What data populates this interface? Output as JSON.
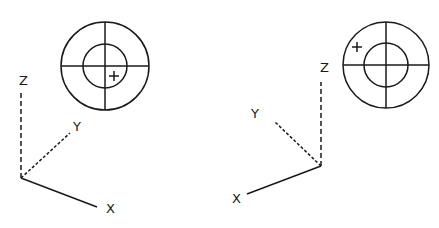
{
  "diagrams": [
    {
      "id": "left",
      "target": {
        "cx": 105,
        "cy": 66,
        "r_outer": 44,
        "r_inner": 22,
        "plus": {
          "x": 114,
          "y": 76
        }
      },
      "axes": {
        "origin": {
          "x": 21,
          "y": 178
        },
        "z": {
          "label": "Z",
          "start_y": 93,
          "label_x": 23,
          "label_y": 85
        },
        "y": {
          "label": "Y",
          "end": {
            "x": 70,
            "y": 133
          },
          "label_x": 77,
          "label_y": 131
        },
        "x": {
          "label": "X",
          "end": {
            "x": 97,
            "y": 207
          },
          "label_x": 110,
          "label_y": 213
        }
      }
    },
    {
      "id": "right",
      "target": {
        "cx": 386,
        "cy": 65,
        "r_outer": 43,
        "r_inner": 22,
        "plus": {
          "x": 357,
          "y": 47
        }
      },
      "axes": {
        "origin": {
          "x": 321,
          "y": 166
        },
        "z": {
          "label": "Z",
          "start_y": 82,
          "label_x": 324,
          "label_y": 72
        },
        "y": {
          "label": "Y",
          "end": {
            "x": 275,
            "y": 122
          },
          "label_x": 255,
          "label_y": 118
        },
        "x": {
          "label": "X",
          "end": {
            "x": 247,
            "y": 194
          },
          "label_x": 236,
          "label_y": 203
        }
      }
    }
  ]
}
